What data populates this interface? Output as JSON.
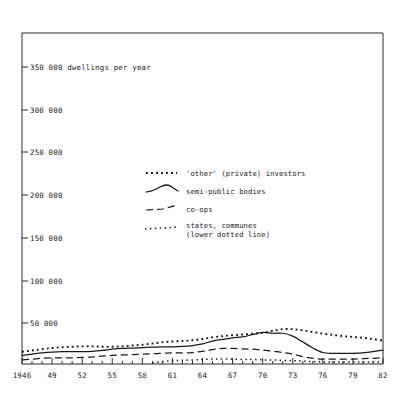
{
  "chart_data": {
    "type": "line",
    "title": "",
    "subtitle": "",
    "ylabel": "350 000 dwellings per year",
    "xlabel": "",
    "unit_note": "dwellings per year",
    "xlim": [
      1946,
      1982
    ],
    "ylim": [
      0,
      365000
    ],
    "grid": false,
    "legend_position": "upper-center",
    "ytick_labels": [
      "350 000",
      "300 000",
      "250 000",
      "200 000",
      "150 000",
      "100 000",
      "50 000"
    ],
    "ytick_values": [
      350000,
      300000,
      250000,
      200000,
      150000,
      100000,
      50000
    ],
    "xtick_labels": [
      "1946",
      "49",
      "52",
      "55",
      "58",
      "61",
      "64",
      "67",
      "70",
      "73",
      "76",
      "79",
      "82"
    ],
    "xtick_values": [
      1946,
      1949,
      1952,
      1955,
      1958,
      1961,
      1964,
      1967,
      1970,
      1973,
      1976,
      1979,
      1982
    ],
    "x": [
      1946,
      1947,
      1948,
      1949,
      1950,
      1951,
      1952,
      1953,
      1954,
      1955,
      1956,
      1957,
      1958,
      1959,
      1960,
      1961,
      1962,
      1963,
      1964,
      1965,
      1966,
      1967,
      1968,
      1969,
      1970,
      1971,
      1972,
      1973,
      1974,
      1975,
      1976,
      1977,
      1978,
      1979,
      1980,
      1981,
      1982
    ],
    "series": [
      {
        "name": "'other' (private) investors",
        "style": "dotted-square",
        "values": [
          15000,
          16500,
          18000,
          19500,
          20500,
          21000,
          21500,
          21500,
          21000,
          21000,
          21500,
          22500,
          23500,
          25000,
          26500,
          27500,
          28000,
          29000,
          30500,
          32500,
          34000,
          35000,
          36000,
          37000,
          38000,
          40500,
          42500,
          42500,
          41000,
          39000,
          37000,
          35500,
          34000,
          33000,
          32000,
          30500,
          28500
        ]
      },
      {
        "name": "semi-public bodies",
        "style": "solid",
        "values": [
          10500,
          12000,
          13500,
          14500,
          15000,
          15000,
          15000,
          15500,
          16500,
          18000,
          19000,
          19500,
          20000,
          20500,
          21000,
          21000,
          21500,
          22500,
          24500,
          28000,
          30000,
          32000,
          33000,
          36000,
          38500,
          37500,
          37500,
          34000,
          27000,
          19500,
          14000,
          13000,
          13000,
          13000,
          13500,
          15000,
          17000
        ]
      },
      {
        "name": "co-ops",
        "style": "dashed",
        "values": [
          5000,
          6000,
          7000,
          7500,
          7500,
          7500,
          8000,
          8500,
          9500,
          10500,
          11000,
          11500,
          12000,
          12500,
          13000,
          13500,
          13500,
          14000,
          15500,
          17500,
          19000,
          19000,
          18500,
          18000,
          17000,
          15500,
          14000,
          12000,
          9000,
          7000,
          6000,
          6000,
          6000,
          6000,
          6500,
          7000,
          7500
        ]
      },
      {
        "name": "states, communes (lower dotted line)",
        "style": "dotted-small",
        "values": [
          null,
          null,
          null,
          null,
          null,
          null,
          null,
          null,
          null,
          null,
          null,
          null,
          null,
          1500,
          3000,
          4000,
          4500,
          5000,
          5500,
          6000,
          6000,
          6000,
          5500,
          5500,
          5000,
          5000,
          4500,
          4000,
          3500,
          3000,
          2500,
          2500,
          2500,
          2500,
          2500,
          2500,
          2500
        ]
      }
    ]
  },
  "legend": {
    "entries": [
      {
        "label": "'other' (private) investors",
        "label2": "",
        "symbol": "dotted-square-sample"
      },
      {
        "label": "semi-public bodies",
        "label2": "",
        "symbol": "solid-wave-sample"
      },
      {
        "label": "co-ops",
        "label2": "",
        "symbol": "dashed-sample"
      },
      {
        "label": "states, communes",
        "label2": "(lower dotted line)",
        "symbol": "dotted-small-sample"
      }
    ]
  },
  "colors": {
    "ink": "#1a1a1a",
    "frame": "#2b2b2b",
    "background": "#ffffff"
  }
}
